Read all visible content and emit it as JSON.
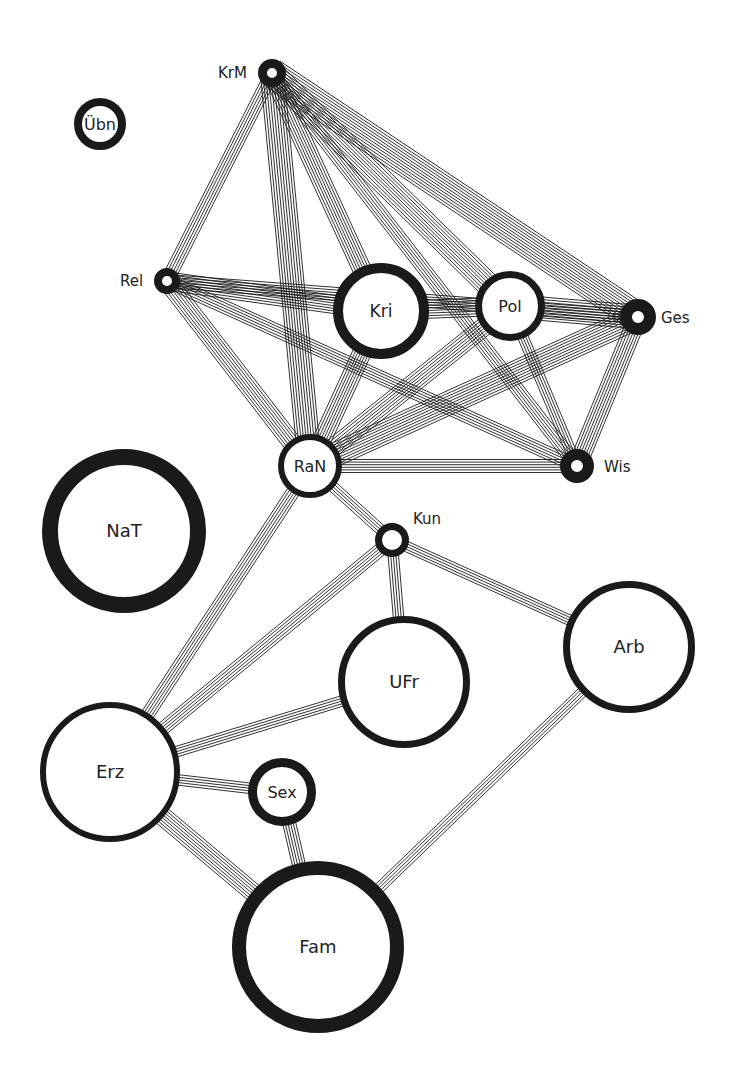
{
  "diagram": {
    "type": "network-graph",
    "colors": {
      "ink": "#1a1a1a",
      "paper": "#ffffff",
      "label": "#222222"
    },
    "nodes": [
      {
        "id": "KrM",
        "label": "KrM",
        "x": 272,
        "y": 73,
        "r": 14,
        "ring": 9,
        "label_pos": "left",
        "lx": 218,
        "ly": 78
      },
      {
        "id": "Ubn",
        "label": "Übn",
        "x": 100,
        "y": 124,
        "r": 26,
        "ring": 8,
        "label_pos": "inside"
      },
      {
        "id": "Rel",
        "label": "Rel",
        "x": 167,
        "y": 281,
        "r": 13,
        "ring": 8,
        "label_pos": "left",
        "lx": 120,
        "ly": 286
      },
      {
        "id": "Kri",
        "label": "Kri",
        "x": 381,
        "y": 311,
        "r": 48,
        "ring": 10,
        "label_pos": "inside"
      },
      {
        "id": "Pol",
        "label": "Pol",
        "x": 510,
        "y": 306,
        "r": 35,
        "ring": 7,
        "label_pos": "inside"
      },
      {
        "id": "Ges",
        "label": "Ges",
        "x": 638,
        "y": 317,
        "r": 18,
        "ring": 12,
        "label_pos": "right",
        "lx": 661,
        "ly": 323
      },
      {
        "id": "RaN",
        "label": "RaN",
        "x": 310,
        "y": 466,
        "r": 32,
        "ring": 6,
        "label_pos": "inside"
      },
      {
        "id": "Wis",
        "label": "Wis",
        "x": 577,
        "y": 466,
        "r": 17,
        "ring": 11,
        "label_pos": "right",
        "lx": 604,
        "ly": 472
      },
      {
        "id": "NaT",
        "label": "NaT",
        "x": 124,
        "y": 531,
        "r": 82,
        "ring": 16,
        "label_pos": "inside"
      },
      {
        "id": "Kun",
        "label": "Kun",
        "x": 392,
        "y": 540,
        "r": 17,
        "ring": 7,
        "label_pos": "above",
        "lx": 413,
        "ly": 524
      },
      {
        "id": "UFr",
        "label": "UFr",
        "x": 404,
        "y": 682,
        "r": 66,
        "ring": 7,
        "label_pos": "inside"
      },
      {
        "id": "Arb",
        "label": "Arb",
        "x": 629,
        "y": 647,
        "r": 66,
        "ring": 7,
        "label_pos": "inside"
      },
      {
        "id": "Erz",
        "label": "Erz",
        "x": 110,
        "y": 772,
        "r": 70,
        "ring": 6,
        "label_pos": "inside"
      },
      {
        "id": "Sex",
        "label": "Sex",
        "x": 282,
        "y": 792,
        "r": 34,
        "ring": 9,
        "label_pos": "inside"
      },
      {
        "id": "Fam",
        "label": "Fam",
        "x": 318,
        "y": 947,
        "r": 86,
        "ring": 14,
        "label_pos": "inside"
      }
    ],
    "edges": [
      {
        "from": "KrM",
        "to": "Rel",
        "lines": 6
      },
      {
        "from": "KrM",
        "to": "RaN",
        "lines": 10
      },
      {
        "from": "KrM",
        "to": "Kri",
        "lines": 8
      },
      {
        "from": "KrM",
        "to": "Pol",
        "lines": 10
      },
      {
        "from": "KrM",
        "to": "Wis",
        "lines": 6
      },
      {
        "from": "KrM",
        "to": "Ges",
        "lines": 12
      },
      {
        "from": "Rel",
        "to": "Kri",
        "lines": 8
      },
      {
        "from": "Rel",
        "to": "Ges",
        "lines": 6
      },
      {
        "from": "Rel",
        "to": "Wis",
        "lines": 6
      },
      {
        "from": "Rel",
        "to": "RaN",
        "lines": 8
      },
      {
        "from": "Kri",
        "to": "Pol",
        "lines": 8
      },
      {
        "from": "Kri",
        "to": "RaN",
        "lines": 8
      },
      {
        "from": "Pol",
        "to": "Ges",
        "lines": 10
      },
      {
        "from": "Pol",
        "to": "RaN",
        "lines": 8
      },
      {
        "from": "Pol",
        "to": "Wis",
        "lines": 5
      },
      {
        "from": "Ges",
        "to": "RaN",
        "lines": 10
      },
      {
        "from": "Ges",
        "to": "Wis",
        "lines": 8
      },
      {
        "from": "RaN",
        "to": "Wis",
        "lines": 6
      },
      {
        "from": "RaN",
        "to": "Kun",
        "lines": 5
      },
      {
        "from": "RaN",
        "to": "Erz",
        "lines": 6
      },
      {
        "from": "Kun",
        "to": "Erz",
        "lines": 6
      },
      {
        "from": "Kun",
        "to": "UFr",
        "lines": 5
      },
      {
        "from": "Kun",
        "to": "Arb",
        "lines": 5
      },
      {
        "from": "UFr",
        "to": "Erz",
        "lines": 5
      },
      {
        "from": "Erz",
        "to": "Sex",
        "lines": 5
      },
      {
        "from": "Erz",
        "to": "Fam",
        "lines": 8
      },
      {
        "from": "Sex",
        "to": "Fam",
        "lines": 6
      },
      {
        "from": "Arb",
        "to": "Fam",
        "lines": 5
      }
    ]
  }
}
